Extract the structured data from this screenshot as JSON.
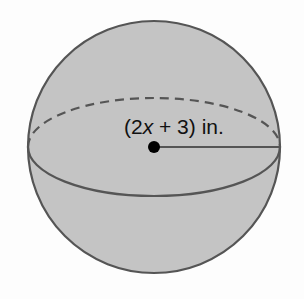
{
  "figure": {
    "shape": "sphere",
    "radius_label": {
      "open": "(2",
      "variable": "x",
      "rest": " + 3) in."
    },
    "colors": {
      "fill": "#c4c4c4",
      "outline": "#555555",
      "center_dot": "#000000",
      "background": "#fdfdfd"
    }
  }
}
